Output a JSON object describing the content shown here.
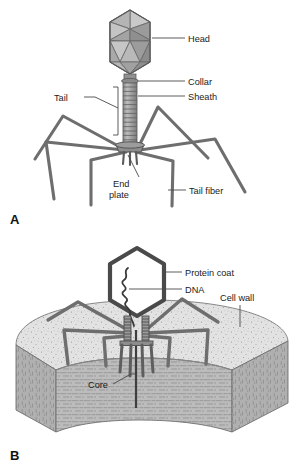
{
  "figure": {
    "background_color": "#ffffff"
  },
  "panels": [
    {
      "id": "A",
      "letter": "A",
      "caption": "Bacteriophage structure",
      "labels": [
        {
          "key": "head",
          "text": "Head"
        },
        {
          "key": "collar",
          "text": "Collar"
        },
        {
          "key": "tail",
          "text": "Tail"
        },
        {
          "key": "sheath",
          "text": "Sheath"
        },
        {
          "key": "end_plate_line1",
          "text": "End"
        },
        {
          "key": "end_plate_line2",
          "text": "plate"
        },
        {
          "key": "tail_fiber",
          "text": "Tail fiber"
        }
      ]
    },
    {
      "id": "B",
      "letter": "B",
      "caption": "Bacteriophage injecting DNA through cell wall",
      "labels": [
        {
          "key": "protein_coat",
          "text": "Protein coat"
        },
        {
          "key": "dna",
          "text": "DNA"
        },
        {
          "key": "cell_wall",
          "text": "Cell wall"
        },
        {
          "key": "core",
          "text": "Core"
        }
      ]
    }
  ],
  "colors": {
    "outline": "#4a4a4a",
    "dark_outline": "#3a3a3a",
    "facet_light": "#c9c9c9",
    "facet_mid": "#a0a0a0",
    "facet_dark": "#8a8a8a",
    "sheath_fill": "#a8a8a8",
    "fiber": "#787878",
    "wall_top": "#dcdcdc",
    "wall_side": "#b4b4b4",
    "text": "#1a1a1a"
  }
}
